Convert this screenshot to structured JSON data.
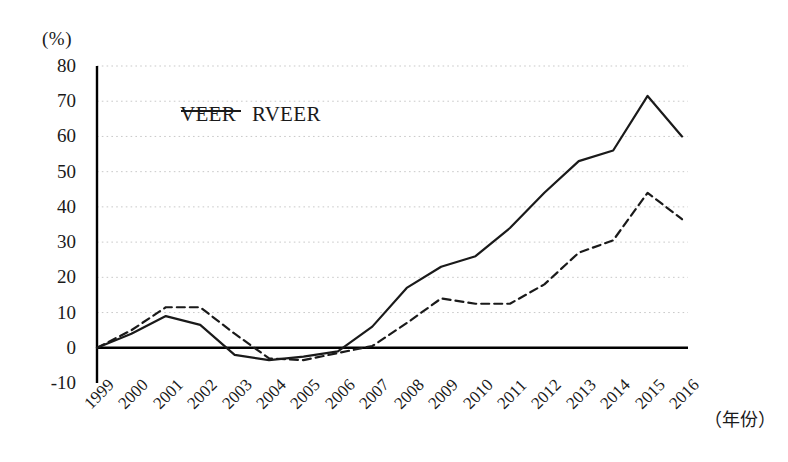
{
  "chart_data": {
    "type": "line",
    "title": "",
    "subtitle": "",
    "xlabel": "（年份）",
    "ylabel": "(%)",
    "ylim": [
      -10,
      80
    ],
    "ytick_step": 10,
    "yticks": [
      "80",
      "70",
      "60",
      "50",
      "40",
      "30",
      "20",
      "10",
      "0",
      "-10"
    ],
    "grid": true,
    "grid_style": "dotted-horizontal",
    "legend_position": "top-left-inside",
    "categories": [
      "1999",
      "2000",
      "2001",
      "2002",
      "2003",
      "2004",
      "2005",
      "2006",
      "2007",
      "2008",
      "2009",
      "2010",
      "2011",
      "2012",
      "2013",
      "2014",
      "2015",
      "2016"
    ],
    "series": [
      {
        "name": "VEER",
        "style": "dashed",
        "color": "#1a1a1a",
        "values": [
          0,
          5,
          11.5,
          11.5,
          4,
          -3,
          -3.5,
          -1.5,
          0.5,
          7,
          14,
          12.5,
          12.5,
          18,
          27,
          30.5,
          44,
          36.5
        ]
      },
      {
        "name": "RVEER",
        "style": "solid",
        "color": "#1a1a1a",
        "values": [
          0,
          4,
          9,
          6.5,
          -2,
          -3.5,
          -2.5,
          -1,
          6,
          17,
          23,
          26,
          34,
          44,
          53,
          56,
          71.5,
          60
        ]
      }
    ],
    "annotations": []
  },
  "legend": {
    "items": [
      {
        "label": "VEER",
        "style": "dashed"
      },
      {
        "label": "RVEER",
        "style": "solid"
      }
    ]
  },
  "colors": {
    "line": "#1a1a1a",
    "axis": "#000000",
    "grid": "#c9c9c9",
    "background": "#ffffff"
  }
}
